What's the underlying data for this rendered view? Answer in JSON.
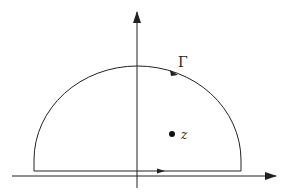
{
  "diagram": {
    "type": "contour-integral-semicircle",
    "stroke_color": "#222222",
    "background": "#ffffff",
    "axes": {
      "horizontal": {
        "x1": 12,
        "y": 176,
        "x2": 276,
        "arrow": "right"
      },
      "vertical": {
        "x": 137,
        "y1": 188,
        "y2": 12,
        "arrow": "up"
      }
    },
    "contour": {
      "label": "Γ",
      "label_pos": {
        "x": 178,
        "y": 67
      },
      "baseline": {
        "x1": 34,
        "x2": 241,
        "y": 171
      },
      "arc_top_y": 66,
      "orientation": "counterclockwise",
      "arc_arrow_pos": {
        "x": 174,
        "y": 73
      },
      "baseline_arrow_pos": {
        "x": 161,
        "y": 171
      }
    },
    "point": {
      "label": "z",
      "pos": {
        "x": 172,
        "y": 134
      },
      "label_pos": {
        "x": 181,
        "y": 139
      }
    }
  }
}
